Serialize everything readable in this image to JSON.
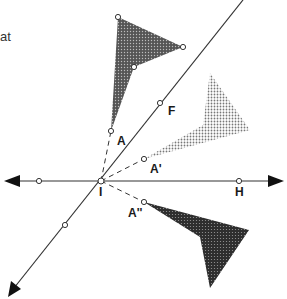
{
  "diagram": {
    "title_fragment": "at",
    "labels": {
      "A": "A",
      "A_prime": "A'",
      "A_double_prime": "A''",
      "F": "F",
      "H": "H",
      "I": "I"
    },
    "lines": {
      "diagonal": {
        "from": [
          8,
          296
        ],
        "to": [
          243,
          0
        ],
        "arrow_at_start": true
      },
      "horizontal": {
        "from": [
          4,
          181
        ],
        "to": [
          284,
          181
        ],
        "arrow_both_ends": true
      }
    },
    "points": {
      "I": [
        101,
        181
      ],
      "A": [
        111,
        131
      ],
      "A_prime": [
        144,
        159
      ],
      "A_double_prime": [
        144,
        202
      ],
      "F": [
        160,
        103
      ],
      "H": [
        239,
        181
      ],
      "left_on_horizontal": [
        39,
        181
      ],
      "lower_on_diagonal": [
        65,
        225
      ],
      "triangle_top_vertex": [
        118,
        17
      ],
      "triangle_right_vertex": [
        183,
        47
      ],
      "triangle_inner_vertex": [
        134,
        67
      ]
    },
    "shapes": {
      "original": {
        "fill": "#3a3a3a",
        "points": [
          [
            111,
            131
          ],
          [
            118,
            17
          ],
          [
            183,
            47
          ],
          [
            134,
            67
          ]
        ]
      },
      "rotated_light": {
        "fill": "#9a9a9a",
        "points": [
          [
            144,
            159
          ],
          [
            203,
            125
          ],
          [
            210,
            73
          ],
          [
            250,
            130
          ]
        ]
      },
      "rotated_dark": {
        "fill": "#2a2a2a",
        "points": [
          [
            144,
            202
          ],
          [
            249,
            230
          ],
          [
            210,
            288
          ],
          [
            200,
            237
          ]
        ]
      }
    }
  }
}
